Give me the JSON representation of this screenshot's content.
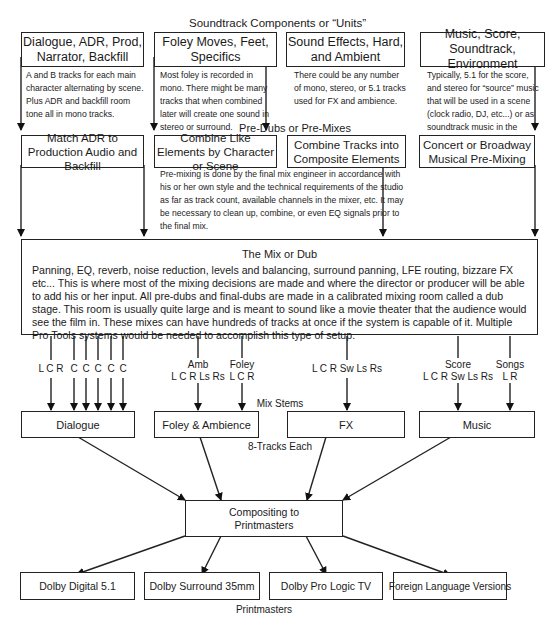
{
  "title": "Soundtrack Components or “Units”",
  "units": [
    {
      "heading": "Dialogue, ADR, Prod, Narrator, Backfill",
      "description": "A and B tracks for each main character alternating by scene. Plus ADR and backfill room tone all in mono tracks."
    },
    {
      "heading": "Foley Moves, Feet, Specifics",
      "description": "Most foley is recorded in mono. There might be many tracks that when combined later will create one sound in stereo or surround."
    },
    {
      "heading": "Sound Effects, Hard, and Ambient",
      "description": "There could be any number of mono, stereo, or 5.1 tracks used for FX and ambience."
    },
    {
      "heading": "Music, Score, Soundtrack, Environment",
      "description": "Typically, 5.1 for the score, and stereo for “source” music that will be used in a scene (clock radio, DJ, etc...) or as soundtrack music in the closing credits etc..."
    }
  ],
  "predubs": {
    "label": "Pre-Dubs or Pre-Mixes",
    "boxes": [
      "Match ADR to Production Audio and Backfill",
      "Combine Like Elements by Character or Scene",
      "Combine Tracks into Composite Elements",
      "Concert or Broadway Musical Pre-Mixing"
    ],
    "description": "Pre-mixing is done by the final mix engineer in accordance with his or her own style and the technical requirements of the studio as far as track count, available channels in the mixer, etc. It may be necessary to clean up, combine, or even EQ signals prior to the final mix."
  },
  "mix": {
    "title": "The Mix or Dub",
    "body": "Panning, EQ, reverb, noise reduction, levels and balancing, surround panning, LFE routing, bizzare FX etc... This is where most of the mixing decisions are made and where the director or producer will be able to add his or her input. All pre-dubs and final-dubs are made in a calibrated mixing room called a dub stage. This room is usually quite large and is meant to sound like a movie theater that the audience would see the film in. These mixes can have hundreds of tracks at once if the system is capable of it. Multiple Pro Tools systems would be needed to accomplish this type of setup."
  },
  "channels": {
    "dialogue": [
      "L C R",
      "C",
      "C",
      "C",
      "C",
      "C"
    ],
    "amb_title": "Amb",
    "amb": "L C R Ls Rs",
    "foley_title": "Foley",
    "foley": "L C R",
    "fx": "L C R Sw Ls Rs",
    "score_title": "Score",
    "score": "L C R Sw Ls Rs",
    "songs_title": "Songs",
    "songs": "L R"
  },
  "stems": {
    "label": "Mix Stems",
    "boxes": [
      "Dialogue",
      "Foley & Ambience",
      "FX",
      "Music"
    ],
    "note": "8-Tracks Each"
  },
  "compositing": "Compositing to Printmasters",
  "printmasters": {
    "boxes": [
      "Dolby Digital 5.1",
      "Dolby Surround 35mm",
      "Dolby Pro Logic TV",
      "Foreign Language Versions"
    ],
    "label": "Printmasters"
  }
}
